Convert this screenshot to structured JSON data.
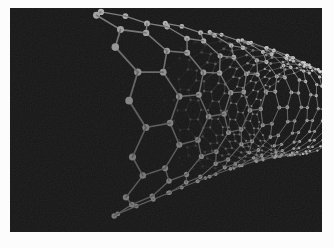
{
  "figure": {
    "alt": "Grayscale 3D ball-and-stick rendering of a single-walled carbon nanotube on a black background",
    "render_style": "ball-and-stick molecular model",
    "lattice": "hexagonal graphene lattice rolled into an open-ended tube"
  },
  "colors": {
    "page_background": "#fcfcfc",
    "photo_background": "#0d0d0d",
    "atom_gray": "#9a9a9a",
    "atom_highlight": "#e3e3e3",
    "bond_gray": "#6e6e6e"
  },
  "tube": {
    "hexagons_around": 16,
    "length": 23,
    "bond_length": 1,
    "bend": 0.7,
    "atom_radius_world": 0.115,
    "bond_width_world": 0.055,
    "camera": {
      "f": 216,
      "cx": 157,
      "cy": 162
    },
    "near_center": [
      -3.8,
      -2.08,
      10
    ],
    "axis": [
      0.786,
      -0.173,
      0.595
    ],
    "light": [
      -0.15,
      -0.9,
      -0.42
    ],
    "lum": {
      "base": 112,
      "depth": 85,
      "diffuse": 58,
      "max": 232,
      "bond_factor": 0.7
    },
    "backwall": {
      "fade_start": 0.3,
      "fade_len": 0.45,
      "dim": 0.72,
      "max_opacity": 0.88
    },
    "grain_opacity": 0.1
  }
}
